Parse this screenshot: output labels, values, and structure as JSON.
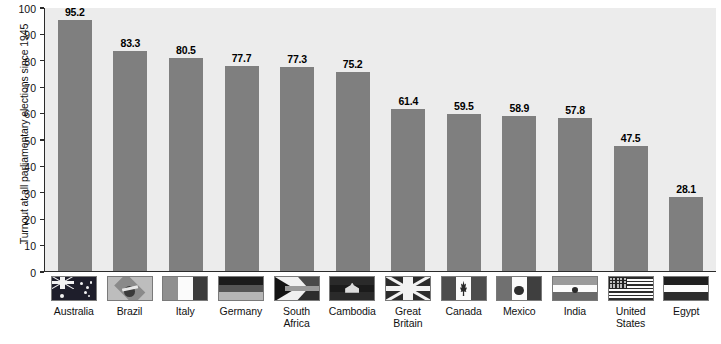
{
  "chart_data": {
    "type": "bar",
    "title": "",
    "xlabel": "",
    "ylabel": "Turnout at all parliamentary elections since 1945",
    "ylim": [
      0,
      100
    ],
    "yticks": [
      0,
      10,
      20,
      30,
      40,
      50,
      60,
      70,
      80,
      90,
      100
    ],
    "grid": false,
    "legend": "none",
    "categories": [
      "Australia",
      "Brazil",
      "Italy",
      "Germany",
      "South\nAfrica",
      "Cambodia",
      "Great\nBritain",
      "Canada",
      "Mexico",
      "India",
      "United\nStates",
      "Egypt"
    ],
    "values": [
      95.2,
      83.3,
      80.5,
      77.7,
      77.3,
      75.2,
      61.4,
      59.5,
      58.9,
      57.8,
      47.5,
      28.1
    ],
    "value_labels": [
      "95.2",
      "83.3",
      "80.5",
      "77.7",
      "77.3",
      "75.2",
      "61.4",
      "59.5",
      "58.9",
      "57.8",
      "47.5",
      "28.1"
    ],
    "flag_icons": [
      "flag-australia-icon",
      "flag-brazil-icon",
      "flag-italy-icon",
      "flag-germany-icon",
      "flag-south-africa-icon",
      "flag-cambodia-icon",
      "flag-great-britain-icon",
      "flag-canada-icon",
      "flag-mexico-icon",
      "flag-india-icon",
      "flag-united-states-icon",
      "flag-egypt-icon"
    ],
    "colors": {
      "bar": "#7f7f7f",
      "plot_background": "#ececec",
      "page_background": "#ffffff",
      "axis": "#2b2b2b",
      "text": "#111111"
    }
  }
}
